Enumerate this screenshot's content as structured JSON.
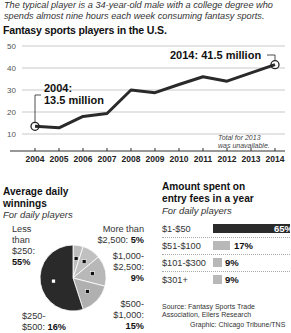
{
  "intro": "The typical player is a 34-year-old male with a college degree who spends almost nine hours each week consuming fantasy sports.",
  "line_title": "Fantasy sports players in the U.S.",
  "line_annotations": {
    "start_label_line1": "2004:",
    "start_label_line2": "13.5 million",
    "end_label": "2014: 41.5 million",
    "note_line1": "Total for 2013",
    "note_line2": "was unavailable."
  },
  "pie_title_line1": "Average daily",
  "pie_title_line2": "winnings",
  "pie_subtitle": "For daily players",
  "pie_labels": {
    "less250_l1": "Less",
    "less250_l2": "than",
    "less250_l3": "$250:",
    "less250_pct": "55%",
    "more2500_l1": "More than",
    "more2500_l2": "$2,500:",
    "more2500_pct": "5%",
    "r1000_l1": "$1,000-",
    "r1000_l2": "$2,500:",
    "r1000_pct": "9%",
    "r500_l1": "$500-",
    "r500_l2": "$1,000:",
    "r500_pct": "15%",
    "r250_l1": "$250-",
    "r250_l2": "$500:",
    "r250_pct": "16%"
  },
  "bar_title_line1": "Amount spent on",
  "bar_title_line2": "entry fees in a year",
  "bar_subtitle": "For daily players",
  "bars": [
    {
      "label": "$1-$50",
      "value": "65%"
    },
    {
      "label": "$51-$100",
      "value": "17%"
    },
    {
      "label": "$101-$300",
      "value": "9%"
    },
    {
      "label": "$301+",
      "value": "9%"
    }
  ],
  "source": "Source: Fantasy Sports Trade Association, Eilers Research",
  "credit": "Graphic: Chicago Tribune/TNS",
  "colors": {
    "dark": "#2a2a2a",
    "light_gray": "#b8b8b8",
    "grid": "#bbbbbb"
  },
  "chart_data": [
    {
      "type": "line",
      "title": "Fantasy sports players in the U.S.",
      "xlabel": "",
      "ylabel": "Millions of players",
      "x": [
        2004,
        2005,
        2006,
        2007,
        2008,
        2009,
        2010,
        2011,
        2012,
        2013,
        2014
      ],
      "series": [
        {
          "name": "Players (millions)",
          "values": [
            13.5,
            12.8,
            18.0,
            19.3,
            30.0,
            28.8,
            32.5,
            36.0,
            34.0,
            null,
            41.5
          ]
        }
      ],
      "yticks": [
        10,
        20,
        30,
        40,
        50
      ],
      "ylim": [
        5,
        52
      ],
      "grid": true,
      "annotations": [
        "2004: 13.5 million",
        "2014: 41.5 million",
        "Total for 2013 was unavailable."
      ]
    },
    {
      "type": "pie",
      "title": "Average daily winnings",
      "subtitle": "For daily players",
      "categories": [
        "Less than $250",
        "$250-$500",
        "$500-$1,000",
        "$1,000-$2,500",
        "More than $2,500"
      ],
      "values": [
        55,
        16,
        15,
        9,
        5
      ]
    },
    {
      "type": "bar",
      "title": "Amount spent on entry fees in a year",
      "subtitle": "For daily players",
      "categories": [
        "$1-$50",
        "$51-$100",
        "$101-$300",
        "$301+"
      ],
      "values": [
        65,
        17,
        9,
        9
      ],
      "orientation": "horizontal",
      "unit": "%"
    }
  ]
}
